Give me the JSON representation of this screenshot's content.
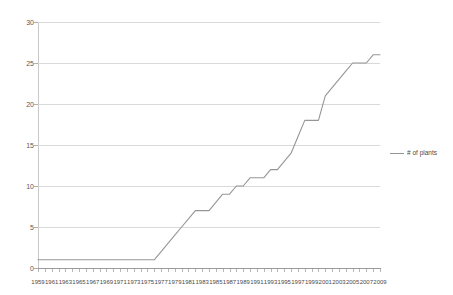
{
  "chart_data": {
    "type": "line",
    "title": "",
    "xlabel": "",
    "ylabel": "",
    "ylim": [
      0,
      30
    ],
    "yticks": [
      0,
      5,
      10,
      15,
      20,
      25,
      30
    ],
    "grid": true,
    "legend_position": "right",
    "legend": [
      "# of plants"
    ],
    "series": [
      {
        "name": "# of plants",
        "color": "#969696",
        "values": [
          1,
          1,
          1,
          1,
          1,
          1,
          1,
          1,
          1,
          1,
          1,
          1,
          1,
          1,
          1,
          1,
          1,
          1,
          2,
          3,
          4,
          5,
          6,
          7,
          7,
          7,
          8,
          9,
          9,
          10,
          10,
          11,
          11,
          11,
          12,
          12,
          13,
          14,
          16,
          18,
          18,
          18,
          21,
          22,
          23,
          24,
          25,
          25,
          25,
          26,
          26
        ]
      }
    ],
    "x": [
      1959,
      1960,
      1961,
      1962,
      1963,
      1964,
      1965,
      1966,
      1967,
      1968,
      1969,
      1970,
      1971,
      1972,
      1973,
      1974,
      1975,
      1976,
      1977,
      1978,
      1979,
      1980,
      1981,
      1982,
      1983,
      1984,
      1985,
      1986,
      1987,
      1988,
      1989,
      1990,
      1991,
      1992,
      1993,
      1994,
      1995,
      1996,
      1997,
      1998,
      1999,
      2000,
      2001,
      2002,
      2003,
      2004,
      2005,
      2006,
      2007,
      2008,
      2009
    ],
    "xticklabels": [
      "1959",
      "1961",
      "1963",
      "1965",
      "1967",
      "1969",
      "1971",
      "1973",
      "1975",
      "1977",
      "1979",
      "1981",
      "1983",
      "1985",
      "1987",
      "1989",
      "1991",
      "1993",
      "1995",
      "1997",
      "1999",
      "2001",
      "2003",
      "2005",
      "2007",
      "2009"
    ],
    "xticklabel_years": [
      1959,
      1961,
      1963,
      1965,
      1967,
      1969,
      1971,
      1973,
      1975,
      1977,
      1979,
      1981,
      1983,
      1985,
      1987,
      1989,
      1991,
      1993,
      1995,
      1997,
      1999,
      2001,
      2003,
      2005,
      2007,
      2009
    ],
    "yticklabels": [
      "0",
      "5",
      "10",
      "15",
      "20",
      "25",
      "30"
    ],
    "colors": {
      "series_line": "#969696",
      "gridline": "#d9d9d9",
      "axis": "#9a9a9a",
      "tick_text": "#4a4a4a",
      "background": "#ffffff"
    }
  }
}
